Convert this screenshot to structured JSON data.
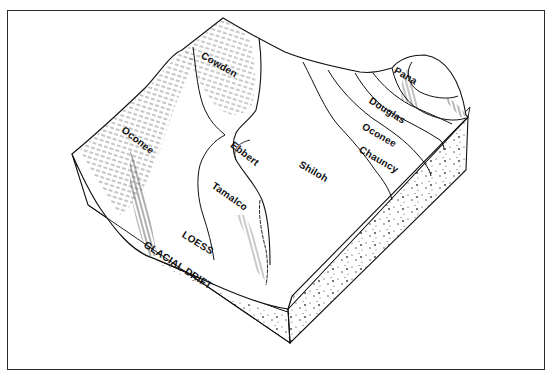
{
  "figure": {
    "type": "block-diagram",
    "colors": {
      "ink": "#111111",
      "frame": "#2a2a2a",
      "background": "#ffffff"
    }
  },
  "soil_labels": {
    "cowden": "Cowden",
    "oconee_left": "Oconee",
    "ebbert": "Ebbert",
    "tamalco": "Tamalco",
    "shiloh": "Shiloh",
    "pana": "Pana",
    "douglas": "Douglas",
    "oconee_right": "Oconee",
    "chauncy": "Chauncy"
  },
  "layer_labels": {
    "loess": "LOESS",
    "glacial_drift": "GLACIAL DRIFT"
  }
}
